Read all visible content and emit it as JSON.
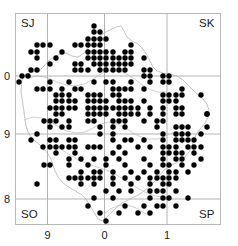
{
  "figure": {
    "type": "distribution-map",
    "frame": {
      "x": 15,
      "y": 13,
      "width": 206,
      "height": 212,
      "color": "#b9b9b9"
    },
    "grid": {
      "color": "#b3b3b3",
      "vertical_x": [
        47.5,
        104.5,
        167.0
      ],
      "horizontal_y": [
        76.0,
        134.0,
        199.0
      ]
    },
    "outline_color": "#c2c2c2",
    "dot": {
      "color": "#000000",
      "radius": 2.7,
      "spacing": 6.35
    }
  },
  "grid_square_labels": [
    {
      "name": "sj",
      "text": "SJ",
      "x": 21,
      "y": 18,
      "corner": "top-left"
    },
    {
      "name": "sk",
      "text": "SK",
      "x": 199,
      "y": 18,
      "corner": "top-right"
    },
    {
      "name": "so",
      "text": "SO",
      "x": 21,
      "y": 209,
      "corner": "bottom-left"
    },
    {
      "name": "sp",
      "text": "SP",
      "x": 199,
      "y": 209,
      "corner": "bottom-right"
    }
  ],
  "x_axis": {
    "ticks": [
      {
        "label": "9",
        "x": 47.5
      },
      {
        "label": "0",
        "x": 104.5
      },
      {
        "label": "1",
        "x": 167.0
      }
    ],
    "label_y": 230
  },
  "y_axis": {
    "ticks": [
      {
        "label": "0",
        "y": 76.0
      },
      {
        "label": "9",
        "y": 134.0
      },
      {
        "label": "8",
        "y": 199.0
      }
    ],
    "label_x": 4
  },
  "chart_data": {
    "type": "scatter",
    "title": "",
    "xlabel": "",
    "ylabel": "",
    "point_count": 292,
    "points": [
      [
        94,
        26
      ],
      [
        100,
        32
      ],
      [
        94,
        32
      ],
      [
        88,
        39
      ],
      [
        94,
        39
      ],
      [
        100,
        39
      ],
      [
        106,
        39
      ],
      [
        75,
        45
      ],
      [
        81,
        45
      ],
      [
        88,
        45
      ],
      [
        94,
        45
      ],
      [
        100,
        45
      ],
      [
        131,
        45
      ],
      [
        37,
        45
      ],
      [
        43,
        45
      ],
      [
        50,
        45
      ],
      [
        31,
        52
      ],
      [
        37,
        52
      ],
      [
        62,
        52
      ],
      [
        88,
        52
      ],
      [
        94,
        52
      ],
      [
        100,
        52
      ],
      [
        106,
        52
      ],
      [
        113,
        52
      ],
      [
        125,
        52
      ],
      [
        131,
        52
      ],
      [
        56,
        58
      ],
      [
        88,
        58
      ],
      [
        94,
        58
      ],
      [
        100,
        58
      ],
      [
        106,
        58
      ],
      [
        113,
        58
      ],
      [
        119,
        58
      ],
      [
        125,
        58
      ],
      [
        131,
        58
      ],
      [
        144,
        58
      ],
      [
        37,
        58
      ],
      [
        75,
        64
      ],
      [
        81,
        64
      ],
      [
        94,
        64
      ],
      [
        100,
        64
      ],
      [
        106,
        64
      ],
      [
        113,
        64
      ],
      [
        119,
        64
      ],
      [
        125,
        64
      ],
      [
        131,
        64
      ],
      [
        50,
        64
      ],
      [
        31,
        70
      ],
      [
        37,
        70
      ],
      [
        75,
        70
      ],
      [
        81,
        70
      ],
      [
        88,
        70
      ],
      [
        100,
        70
      ],
      [
        106,
        70
      ],
      [
        113,
        70
      ],
      [
        119,
        70
      ],
      [
        125,
        70
      ],
      [
        144,
        70
      ],
      [
        150,
        70
      ],
      [
        22,
        76
      ],
      [
        28,
        76
      ],
      [
        144,
        76
      ],
      [
        150,
        76
      ],
      [
        163,
        76
      ],
      [
        169,
        76
      ],
      [
        19,
        82
      ],
      [
        50,
        82
      ],
      [
        69,
        82
      ],
      [
        94,
        82
      ],
      [
        106,
        82
      ],
      [
        113,
        82
      ],
      [
        131,
        82
      ],
      [
        150,
        82
      ],
      [
        163,
        82
      ],
      [
        169,
        82
      ],
      [
        37,
        89
      ],
      [
        43,
        89
      ],
      [
        50,
        89
      ],
      [
        62,
        89
      ],
      [
        75,
        89
      ],
      [
        81,
        89
      ],
      [
        113,
        89
      ],
      [
        119,
        89
      ],
      [
        125,
        89
      ],
      [
        131,
        89
      ],
      [
        144,
        89
      ],
      [
        182,
        89
      ],
      [
        56,
        95
      ],
      [
        62,
        95
      ],
      [
        69,
        95
      ],
      [
        88,
        95
      ],
      [
        94,
        95
      ],
      [
        100,
        95
      ],
      [
        113,
        95
      ],
      [
        119,
        95
      ],
      [
        163,
        95
      ],
      [
        169,
        95
      ],
      [
        176,
        95
      ],
      [
        182,
        95
      ],
      [
        201,
        95
      ],
      [
        56,
        101
      ],
      [
        62,
        101
      ],
      [
        69,
        101
      ],
      [
        75,
        101
      ],
      [
        88,
        101
      ],
      [
        94,
        101
      ],
      [
        100,
        101
      ],
      [
        106,
        101
      ],
      [
        119,
        101
      ],
      [
        125,
        101
      ],
      [
        131,
        101
      ],
      [
        144,
        101
      ],
      [
        163,
        101
      ],
      [
        169,
        101
      ],
      [
        176,
        101
      ],
      [
        50,
        108
      ],
      [
        56,
        108
      ],
      [
        62,
        108
      ],
      [
        69,
        108
      ],
      [
        75,
        108
      ],
      [
        88,
        108
      ],
      [
        94,
        108
      ],
      [
        100,
        108
      ],
      [
        106,
        108
      ],
      [
        113,
        108
      ],
      [
        119,
        108
      ],
      [
        125,
        108
      ],
      [
        131,
        108
      ],
      [
        138,
        108
      ],
      [
        150,
        108
      ],
      [
        163,
        108
      ],
      [
        176,
        108
      ],
      [
        182,
        108
      ],
      [
        56,
        114
      ],
      [
        62,
        114
      ],
      [
        88,
        114
      ],
      [
        94,
        114
      ],
      [
        100,
        114
      ],
      [
        106,
        114
      ],
      [
        119,
        114
      ],
      [
        125,
        114
      ],
      [
        131,
        114
      ],
      [
        138,
        114
      ],
      [
        150,
        114
      ],
      [
        163,
        114
      ],
      [
        176,
        114
      ],
      [
        182,
        114
      ],
      [
        207,
        114
      ],
      [
        50,
        121
      ],
      [
        56,
        121
      ],
      [
        69,
        121
      ],
      [
        88,
        121
      ],
      [
        94,
        121
      ],
      [
        113,
        121
      ],
      [
        119,
        121
      ],
      [
        125,
        121
      ],
      [
        144,
        121
      ],
      [
        157,
        121
      ],
      [
        163,
        121
      ],
      [
        207,
        114
      ],
      [
        62,
        127
      ],
      [
        69,
        127
      ],
      [
        100,
        127
      ],
      [
        113,
        127
      ],
      [
        125,
        127
      ],
      [
        157,
        127
      ],
      [
        176,
        127
      ],
      [
        182,
        127
      ],
      [
        188,
        127
      ],
      [
        207,
        127
      ],
      [
        44,
        121
      ],
      [
        50,
        127
      ],
      [
        100,
        134
      ],
      [
        113,
        134
      ],
      [
        163,
        134
      ],
      [
        176,
        134
      ],
      [
        182,
        134
      ],
      [
        188,
        134
      ],
      [
        201,
        134
      ],
      [
        37,
        134
      ],
      [
        31,
        140
      ],
      [
        69,
        140
      ],
      [
        75,
        140
      ],
      [
        113,
        140
      ],
      [
        125,
        140
      ],
      [
        131,
        140
      ],
      [
        144,
        140
      ],
      [
        163,
        140
      ],
      [
        176,
        140
      ],
      [
        182,
        140
      ],
      [
        188,
        140
      ],
      [
        194,
        140
      ],
      [
        50,
        140
      ],
      [
        56,
        140
      ],
      [
        50,
        147
      ],
      [
        56,
        147
      ],
      [
        62,
        147
      ],
      [
        69,
        147
      ],
      [
        75,
        147
      ],
      [
        88,
        147
      ],
      [
        94,
        147
      ],
      [
        100,
        147
      ],
      [
        119,
        147
      ],
      [
        138,
        147
      ],
      [
        150,
        147
      ],
      [
        163,
        147
      ],
      [
        169,
        147
      ],
      [
        176,
        147
      ],
      [
        188,
        147
      ],
      [
        194,
        147
      ],
      [
        201,
        147
      ],
      [
        43,
        147
      ],
      [
        56,
        153
      ],
      [
        75,
        153
      ],
      [
        113,
        153
      ],
      [
        125,
        153
      ],
      [
        163,
        153
      ],
      [
        169,
        153
      ],
      [
        176,
        153
      ],
      [
        182,
        153
      ],
      [
        194,
        153
      ],
      [
        69,
        159
      ],
      [
        81,
        159
      ],
      [
        106,
        159
      ],
      [
        119,
        159
      ],
      [
        144,
        159
      ],
      [
        163,
        159
      ],
      [
        176,
        159
      ],
      [
        182,
        159
      ],
      [
        201,
        159
      ],
      [
        94,
        159
      ],
      [
        44,
        165
      ],
      [
        69,
        165
      ],
      [
        88,
        165
      ],
      [
        106,
        165
      ],
      [
        125,
        165
      ],
      [
        150,
        165
      ],
      [
        163,
        165
      ],
      [
        169,
        165
      ],
      [
        182,
        165
      ],
      [
        194,
        165
      ],
      [
        50,
        165
      ],
      [
        81,
        172
      ],
      [
        100,
        172
      ],
      [
        113,
        172
      ],
      [
        131,
        172
      ],
      [
        144,
        172
      ],
      [
        157,
        172
      ],
      [
        169,
        172
      ],
      [
        176,
        172
      ],
      [
        188,
        172
      ],
      [
        94,
        172
      ],
      [
        69,
        178
      ],
      [
        75,
        178
      ],
      [
        81,
        178
      ],
      [
        88,
        178
      ],
      [
        94,
        178
      ],
      [
        100,
        178
      ],
      [
        113,
        178
      ],
      [
        125,
        178
      ],
      [
        138,
        178
      ],
      [
        150,
        178
      ],
      [
        157,
        178
      ],
      [
        163,
        178
      ],
      [
        169,
        178
      ],
      [
        176,
        178
      ],
      [
        37,
        184
      ],
      [
        81,
        184
      ],
      [
        94,
        184
      ],
      [
        113,
        184
      ],
      [
        131,
        184
      ],
      [
        150,
        184
      ],
      [
        163,
        184
      ],
      [
        169,
        184
      ],
      [
        106,
        191
      ],
      [
        119,
        191
      ],
      [
        131,
        191
      ],
      [
        150,
        191
      ],
      [
        157,
        191
      ],
      [
        163,
        191
      ],
      [
        176,
        191
      ],
      [
        94,
        198
      ],
      [
        113,
        198
      ],
      [
        150,
        198
      ],
      [
        163,
        198
      ],
      [
        169,
        198
      ],
      [
        188,
        198
      ],
      [
        88,
        206
      ],
      [
        125,
        206
      ],
      [
        144,
        206
      ],
      [
        157,
        206
      ],
      [
        163,
        206
      ],
      [
        176,
        206
      ],
      [
        100,
        213
      ],
      [
        119,
        213
      ],
      [
        138,
        213
      ],
      [
        150,
        213
      ],
      [
        106,
        221
      ]
    ]
  }
}
